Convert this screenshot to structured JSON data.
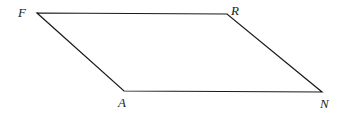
{
  "figure": {
    "name": "parallelogram-FRNA",
    "type": "parallelogram",
    "stroke_color": "#1a1a1a",
    "fill_color": "none",
    "stroke_width": 1.2,
    "background_color": "#ffffff",
    "canvas": {
      "width": 356,
      "height": 116
    },
    "vertices": [
      {
        "id": "F",
        "label": "F",
        "x": 37,
        "y": 13,
        "label_x": 18,
        "label_y": 6,
        "label_position": "left-above"
      },
      {
        "id": "R",
        "label": "R",
        "x": 227,
        "y": 14,
        "label_x": 231,
        "label_y": 4,
        "label_position": "right-above"
      },
      {
        "id": "N",
        "label": "N",
        "x": 322,
        "y": 92,
        "label_x": 320,
        "label_y": 97,
        "label_position": "right-below"
      },
      {
        "id": "A",
        "label": "A",
        "x": 124,
        "y": 91,
        "label_x": 118,
        "label_y": 96,
        "label_position": "left-below"
      }
    ],
    "edges": [
      {
        "id": "FR",
        "from": "F",
        "to": "R",
        "label": ""
      },
      {
        "id": "RN",
        "from": "R",
        "to": "N",
        "label": ""
      },
      {
        "id": "NA",
        "from": "N",
        "to": "A",
        "label": ""
      },
      {
        "id": "AF",
        "from": "A",
        "to": "F",
        "label": ""
      }
    ],
    "polygon_points": "37,13 227,14 322,92 124,91"
  }
}
